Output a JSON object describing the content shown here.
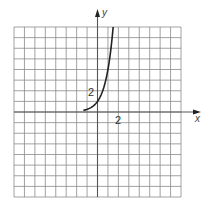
{
  "chart_data": {
    "type": "line",
    "title": "",
    "xlabel": "x",
    "ylabel": "y",
    "xlim": [
      -8,
      8
    ],
    "ylim": [
      -8,
      8
    ],
    "grid": true,
    "grid_step": 1,
    "tick_labels": {
      "x": [
        "2"
      ],
      "y": [
        "2"
      ]
    },
    "tick_label_positions": {
      "x": [
        2
      ],
      "y": [
        2
      ]
    },
    "legend": null,
    "series": [
      {
        "name": "curve",
        "function": "y = 4^x",
        "x": [
          -1.35,
          -1,
          -0.5,
          0,
          0.5,
          0.87,
          1,
          1.25,
          1.5
        ],
        "y": [
          0.15,
          0.25,
          0.5,
          1,
          2,
          3.34,
          4,
          5.66,
          8
        ]
      }
    ]
  },
  "labels": {
    "x_axis": "x",
    "y_axis": "y",
    "x_tick": "2",
    "y_tick": "2"
  },
  "colors": {
    "grid": "#8a8a8a",
    "axis": "#555555",
    "curve": "#222222"
  }
}
